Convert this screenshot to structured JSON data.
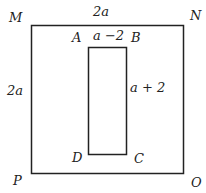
{
  "diagram": {
    "outer": {
      "corners": {
        "top_left": "M",
        "top_right": "N",
        "bottom_right": "O",
        "bottom_left": "P"
      },
      "top_label": "2a",
      "left_label": "2a"
    },
    "inner": {
      "corners": {
        "top_left": "A",
        "top_right": "B",
        "bottom_right": "C",
        "bottom_left": "D"
      },
      "top_label": "a −2",
      "right_label": "a + 2"
    }
  }
}
